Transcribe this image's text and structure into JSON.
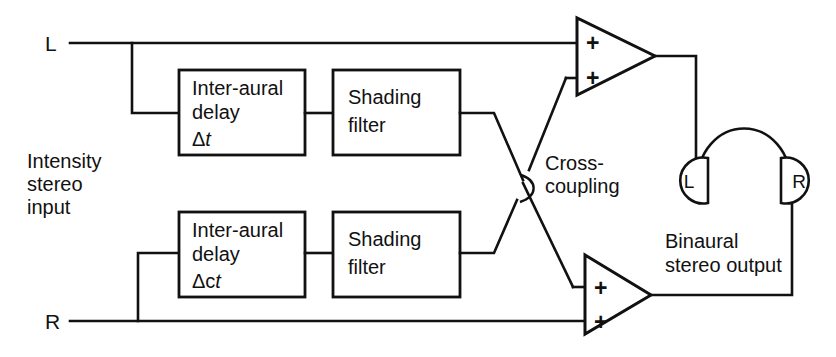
{
  "diagram": {
    "inputs": {
      "left_label": "L",
      "right_label": "R",
      "source_label_line1": "Intensity",
      "source_label_line2": "stereo",
      "source_label_line3": "input"
    },
    "blocks": {
      "top_delay": {
        "line1": "Inter-aural",
        "line2": "delay",
        "line3_symbol": "Δ",
        "line3_var": "t"
      },
      "top_filter": {
        "line1": "Shading",
        "line2": "filter"
      },
      "bottom_delay": {
        "line1": "Inter-aural",
        "line2": "delay",
        "line3_symbol": "Δc",
        "line3_var": "t"
      },
      "bottom_filter": {
        "line1": "Shading",
        "line2": "filter"
      }
    },
    "cross": {
      "label_line1": "Cross-",
      "label_line2": "coupling"
    },
    "amplifiers": {
      "top": {
        "input_a": "+",
        "input_b": "+"
      },
      "bottom": {
        "input_a": "+",
        "input_b": "+"
      }
    },
    "headphones": {
      "left_cup_label": "L",
      "right_cup_label": "R"
    },
    "output": {
      "label_line1": "Binaural",
      "label_line2": "stereo output"
    },
    "colors": {
      "ink": "#111111",
      "paper": "#ffffff"
    }
  }
}
